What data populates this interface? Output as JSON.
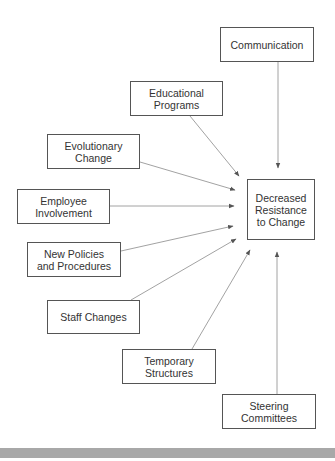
{
  "diagram": {
    "target": {
      "id": "decreased-resistance",
      "label": "Decreased\nResistance\nto Change",
      "box": [
        247,
        179,
        68,
        61
      ]
    },
    "sources": [
      {
        "id": "communication",
        "label": "Communication",
        "box": [
          220,
          27,
          94,
          35
        ],
        "edge": [
          278,
          62,
          278,
          168
        ]
      },
      {
        "id": "educational-programs",
        "label": "Educational\nPrograms",
        "box": [
          130,
          81,
          93,
          35
        ],
        "edge": [
          190,
          116,
          239,
          176
        ]
      },
      {
        "id": "evolutionary-change",
        "label": "Evolutionary\nChange",
        "box": [
          47,
          134,
          93,
          35
        ],
        "edge": [
          140,
          162,
          235,
          190
        ]
      },
      {
        "id": "employee-involvement",
        "label": "Employee\nInvolvement",
        "box": [
          17,
          189,
          93,
          35
        ],
        "edge": [
          110,
          206,
          234,
          206
        ]
      },
      {
        "id": "new-policies-and-procedures",
        "label": "New Policies\nand Procedures",
        "box": [
          27,
          242,
          94,
          35
        ],
        "edge": [
          121,
          251,
          233,
          226
        ]
      },
      {
        "id": "staff-changes",
        "label": "Staff Changes",
        "box": [
          47,
          300,
          93,
          34
        ],
        "edge": [
          131,
          300,
          236,
          239
        ]
      },
      {
        "id": "temporary-structures",
        "label": "Temporary\nStructures",
        "box": [
          122,
          349,
          94,
          35
        ],
        "edge": [
          192,
          349,
          250,
          250
        ]
      },
      {
        "id": "steering-committees",
        "label": "Steering\nCommittees",
        "box": [
          222,
          394,
          94,
          35
        ],
        "edge": [
          277,
          394,
          277,
          252
        ]
      }
    ],
    "colors": {
      "box_border": "#555555",
      "text": "#333333",
      "edge": "#8a8a8a",
      "bottom_bar": "#a8a8a8"
    }
  }
}
